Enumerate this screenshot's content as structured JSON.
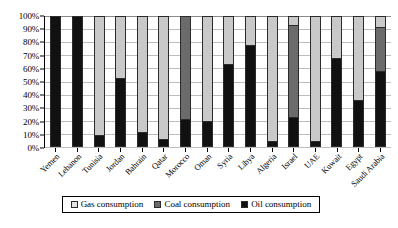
{
  "chart_data": {
    "type": "bar",
    "stacked": true,
    "stack_mode": "percent",
    "title": "",
    "subtitle": "",
    "xlabel": "",
    "ylabel": "",
    "ylim": [
      0,
      100
    ],
    "y_tick_labels": [
      "100%",
      "90%",
      "80%",
      "70%",
      "60%",
      "50%",
      "40%",
      "30%",
      "20%",
      "10%",
      "0%"
    ],
    "y_tick_values": [
      100,
      90,
      80,
      70,
      60,
      50,
      40,
      30,
      20,
      10,
      0
    ],
    "grid": true,
    "legend_position": "bottom",
    "categories": [
      "Yemen",
      "Lebanon",
      "Tunisia",
      "Jordan",
      "Bahrain",
      "Qatar",
      "Morocco",
      "Oman",
      "Syria",
      "Libya",
      "Algeria",
      "Israel",
      "UAE",
      "Kuwait",
      "Egypt",
      "Saudi Arabia"
    ],
    "series": [
      {
        "name": "Oil consumption",
        "color": "#111111",
        "values": [
          100,
          100,
          8,
          52,
          10,
          5,
          20,
          19,
          63,
          78,
          3,
          22,
          3,
          68,
          35,
          58
        ]
      },
      {
        "name": "Coal consumption",
        "color": "#6b6b6b",
        "values": [
          0,
          0,
          0,
          0,
          0,
          0,
          80,
          0,
          0,
          0,
          0,
          72,
          0,
          0,
          0,
          34
        ]
      },
      {
        "name": "Gas consumption",
        "color": "#c9c9c9",
        "values": [
          0,
          0,
          92,
          48,
          90,
          95,
          0,
          81,
          37,
          22,
          97,
          6,
          97,
          32,
          65,
          8
        ]
      }
    ],
    "legend_entries": [
      {
        "label": "Gas consumption",
        "swatch": "sw-gas"
      },
      {
        "label": "Coal consumption",
        "swatch": "sw-coal"
      },
      {
        "label": "Oil consumption",
        "swatch": "sw-oil"
      }
    ]
  }
}
